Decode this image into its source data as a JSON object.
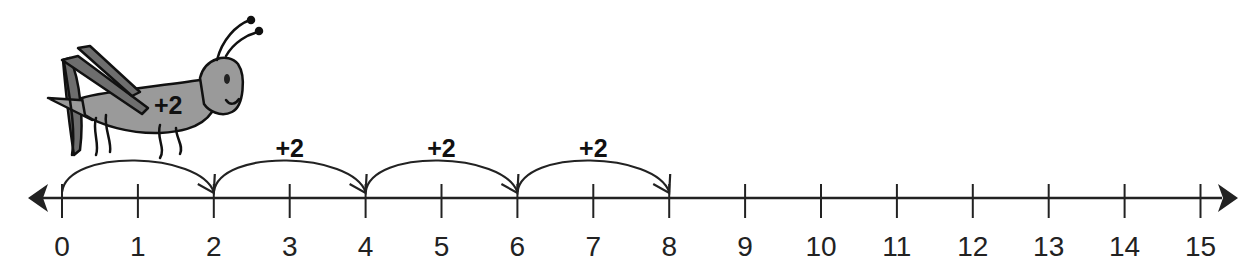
{
  "diagram": {
    "type": "number-line",
    "title": "",
    "range": [
      0,
      15
    ],
    "ticks": [
      "0",
      "1",
      "2",
      "3",
      "4",
      "5",
      "6",
      "7",
      "8",
      "9",
      "10",
      "11",
      "12",
      "13",
      "14",
      "15"
    ],
    "jumps": [
      {
        "from": 0,
        "to": 2,
        "label": "+2"
      },
      {
        "from": 2,
        "to": 4,
        "label": "+2"
      },
      {
        "from": 4,
        "to": 6,
        "label": "+2"
      },
      {
        "from": 6,
        "to": 8,
        "label": "+2"
      }
    ],
    "character": {
      "name": "grasshopper",
      "label": "+2"
    },
    "colors": {
      "line": "#222222",
      "grasshopper_body": "#9a9a9a",
      "grasshopper_legs": "#6e6e6e"
    }
  }
}
